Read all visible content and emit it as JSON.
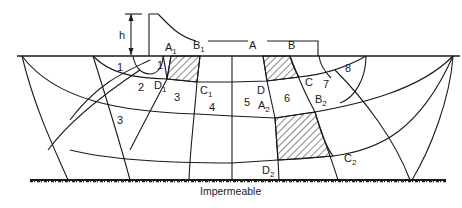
{
  "diagram": {
    "head_label": "h",
    "structure_points": [
      {
        "name": "A",
        "sub": "1"
      },
      {
        "name": "B",
        "sub": "1"
      },
      {
        "name": "A",
        "sub": ""
      },
      {
        "name": "B",
        "sub": ""
      }
    ],
    "flow_net_points": [
      {
        "name": "D",
        "sub": "1"
      },
      {
        "name": "C",
        "sub": "1"
      },
      {
        "name": "D",
        "sub": ""
      },
      {
        "name": "C",
        "sub": ""
      },
      {
        "name": "A",
        "sub": "2"
      },
      {
        "name": "B",
        "sub": "2"
      },
      {
        "name": "D",
        "sub": "2"
      },
      {
        "name": "C",
        "sub": "2"
      }
    ],
    "field_numbers": [
      "1",
      "1",
      "2",
      "3",
      "3",
      "4",
      "5",
      "6",
      "7",
      "8"
    ],
    "boundary_label": "Impermeable",
    "hatched_elements": 3
  }
}
